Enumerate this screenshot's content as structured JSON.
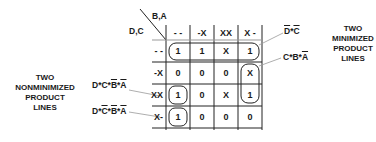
{
  "diagram": {
    "type": "karnaugh-map",
    "axis_labels": {
      "columns": "B,A",
      "rows": "D,C"
    },
    "column_headers": [
      "- -",
      "-X",
      "XX",
      "X -"
    ],
    "row_headers": [
      "- -",
      "-X",
      "XX",
      "X-"
    ],
    "cells": [
      [
        "1",
        "1",
        "X",
        "1"
      ],
      [
        "0",
        "0",
        "0",
        "X"
      ],
      [
        "1",
        "0",
        "X",
        "1"
      ],
      [
        "1",
        "0",
        "0",
        "0"
      ]
    ],
    "groupings": [
      {
        "name": "D'C'",
        "cells": [
          [
            0,
            0
          ],
          [
            0,
            1
          ],
          [
            0,
            2
          ],
          [
            0,
            3
          ]
        ]
      },
      {
        "name": "CB A'",
        "cells": [
          [
            1,
            3
          ],
          [
            2,
            3
          ]
        ]
      },
      {
        "name": "DCB'A'",
        "cells": [
          [
            2,
            0
          ]
        ]
      },
      {
        "name": "DC'B'A'",
        "cells": [
          [
            3,
            0
          ]
        ]
      }
    ],
    "right_annotations": [
      {
        "id": "dbar-cbar",
        "parts": [
          {
            "t": "D",
            "bar": true
          },
          {
            "t": "*"
          },
          {
            "t": "C",
            "bar": true
          }
        ]
      },
      {
        "id": "c-b-abar",
        "parts": [
          {
            "t": "C*B*"
          },
          {
            "t": "A",
            "bar": true
          }
        ]
      }
    ],
    "left_annotations": [
      {
        "id": "d-c-bbar-abar",
        "parts": [
          {
            "t": "D*C*"
          },
          {
            "t": "B",
            "bar": true
          },
          {
            "t": "*"
          },
          {
            "t": "A",
            "bar": true
          }
        ]
      },
      {
        "id": "d-cbar-bbar-abar",
        "parts": [
          {
            "t": "D*"
          },
          {
            "t": "C",
            "bar": true
          },
          {
            "t": "*"
          },
          {
            "t": "B",
            "bar": true
          },
          {
            "t": "*"
          },
          {
            "t": "A",
            "bar": true
          }
        ]
      }
    ],
    "right_title": [
      "TWO",
      "MINIMIZED",
      "PRODUCT",
      "LINES"
    ],
    "left_title": [
      "TWO",
      "NONMINIMIZED",
      "PRODUCT",
      "LINES"
    ]
  }
}
